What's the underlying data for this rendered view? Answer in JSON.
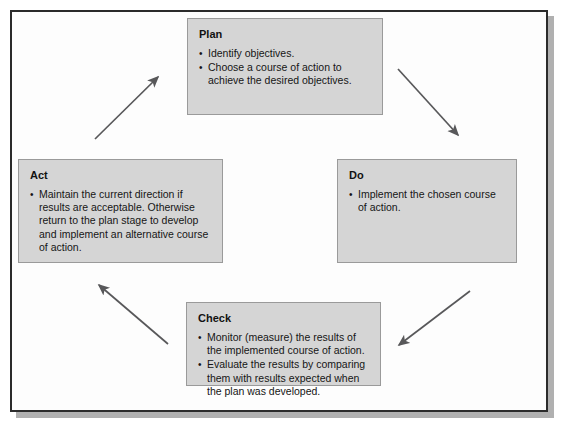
{
  "diagram": {
    "name": "PDCA cycle diagram",
    "direction": "clockwise",
    "box_fill_color": "#d5d5d5",
    "box_border_color": "#9a9a9a",
    "frame_border_color": "#2b2b2b",
    "arrow_color": "#58585a",
    "stages": [
      {
        "id": "plan",
        "title": "Plan",
        "bullets": [
          "Identify objectives.",
          "Choose a course of action to achieve the desired objectives."
        ]
      },
      {
        "id": "do",
        "title": "Do",
        "bullets": [
          "Implement the chosen course of action."
        ]
      },
      {
        "id": "check",
        "title": "Check",
        "bullets": [
          "Monitor (measure) the results of the implemented course of action.",
          "Evaluate the results by comparing them with results expected when the plan was developed."
        ]
      },
      {
        "id": "act",
        "title": "Act",
        "bullets": [
          "Maintain the current direction if results are acceptable. Otherwise return to the plan stage to develop and implement an alternative course of action."
        ]
      }
    ],
    "arrows": [
      {
        "id": "plan-to-do",
        "from": "plan",
        "to": "do"
      },
      {
        "id": "do-to-check",
        "from": "do",
        "to": "check"
      },
      {
        "id": "check-to-act",
        "from": "check",
        "to": "act"
      },
      {
        "id": "act-to-plan",
        "from": "act",
        "to": "plan"
      }
    ]
  }
}
